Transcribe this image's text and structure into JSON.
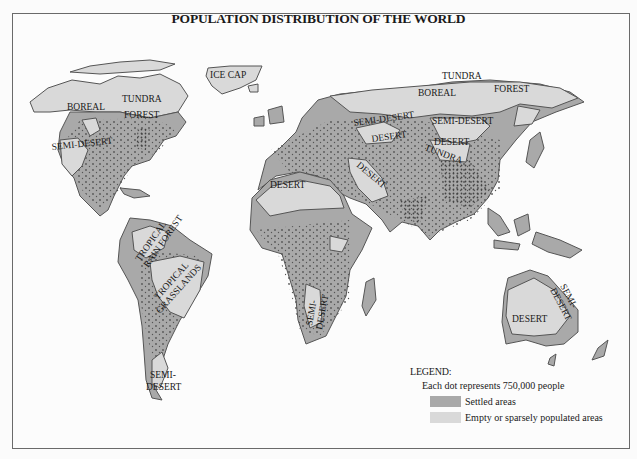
{
  "title": "POPULATION DISTRIBUTION OF THE WORLD",
  "colors": {
    "settled": "#a9a9a9",
    "empty": "#d9d9d9",
    "outline": "#555555",
    "dots": "#555555",
    "frame": "#6a6a6a"
  },
  "regions": {
    "north_america": {
      "labels": [
        "BOREAL",
        "TUNDRA",
        "FOREST",
        "SEMI-DESERT"
      ]
    },
    "greenland": {
      "labels": [
        "ICE CAP"
      ]
    },
    "south_america": {
      "labels": [
        "TROPICAL",
        "RAIN FOREST",
        "TROPICAL",
        "GRASSLANDS",
        "SEMI-",
        "DESERT"
      ]
    },
    "africa": {
      "labels": [
        "DESERT",
        "SEMI-",
        "DESERT"
      ]
    },
    "middle_east": {
      "labels": [
        "DESERT"
      ]
    },
    "eurasia": {
      "labels": [
        "TUNDRA",
        "BOREAL",
        "FOREST",
        "SEMI-DESERT",
        "DESERT",
        "SEMI-DESERT",
        "DESERT",
        "TUNDRA"
      ]
    },
    "australia": {
      "labels": [
        "DESERT",
        "SEMI-",
        "DESERT"
      ]
    }
  },
  "legend": {
    "title": "LEGEND:",
    "note": "Each dot represents 750,000 people",
    "items": [
      {
        "label": "Settled areas",
        "color": "#a9a9a9"
      },
      {
        "label": "Empty or sparsely populated areas",
        "color": "#d9d9d9"
      }
    ]
  }
}
